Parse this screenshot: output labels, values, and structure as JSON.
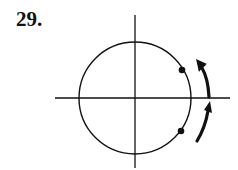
{
  "problem": {
    "number_label": "29."
  },
  "figure": {
    "colors": {
      "stroke": "#111111",
      "background": "#ffffff"
    },
    "axes": {
      "horizontal": {
        "x1": 55,
        "y": 98,
        "x2": 230
      },
      "vertical": {
        "x": 135,
        "y1": 15,
        "y2": 168
      }
    },
    "circle": {
      "cx": 135,
      "cy": 98,
      "r": 56
    },
    "points": [
      {
        "name": "upper-point",
        "cx": 182,
        "cy": 70
      },
      {
        "name": "lower-point",
        "cx": 181,
        "cy": 131
      }
    ],
    "arrows": [
      {
        "name": "upper-arrow",
        "direction": "counterclockwise"
      },
      {
        "name": "lower-arrow",
        "direction": "counterclockwise"
      }
    ]
  }
}
